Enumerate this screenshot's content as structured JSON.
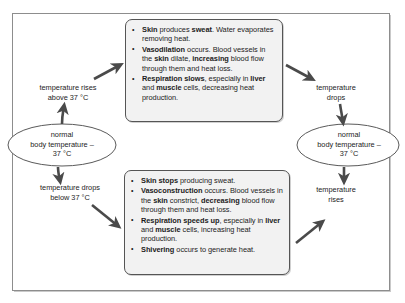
{
  "diagram": {
    "frame_border_color": "#8d8d8d",
    "box_fill_color": "#f2f2f2",
    "box_border_color": "#555555",
    "arrow_color": "#4a4a4a",
    "nodes": {
      "left_ellipse": {
        "line1": "normal",
        "line2": "body temperature –",
        "line3": "37 °C"
      },
      "right_ellipse": {
        "line1": "normal",
        "line2": "body temperature –",
        "line3": "37 °C"
      }
    },
    "edge_labels": {
      "temp_rises_above": {
        "line1": "temperature rises",
        "line2": "above 37 °C"
      },
      "temp_drops_below": {
        "line1": "temperature drops",
        "line2": "below 37 °C"
      },
      "temp_drops": {
        "line1": "temperature",
        "line2": "drops"
      },
      "temp_rises": {
        "line1": "temperature",
        "line2": "rises"
      }
    },
    "heat_loss_box": {
      "bullets": [
        "<b>Skin</b> produces <b>sweat</b>. Water evaporates removing heat.",
        "<b>Vasodilation</b> occurs. Blood vessels in the <b>skin</b> dilate, <b>increasing</b> blood flow through them and heat loss.",
        "<b>Respiration slows</b>, especially in <b>liver</b> and <b>muscle</b> cells, decreasing heat production."
      ]
    },
    "heat_gain_box": {
      "bullets": [
        "<b>Skin stops</b> producing sweat.",
        "<b>Vasoconstruction</b> occurs. Blood vessels in the <b>skin</b> constrict, <b>decreasing</b> blood flow through them and heat loss.",
        "<b>Respiration speeds up</b>, especially in <b>liver</b> and <b>muscle</b> cells, increasing heat production.",
        "<b>Shivering</b> occurs to generate heat."
      ]
    }
  }
}
